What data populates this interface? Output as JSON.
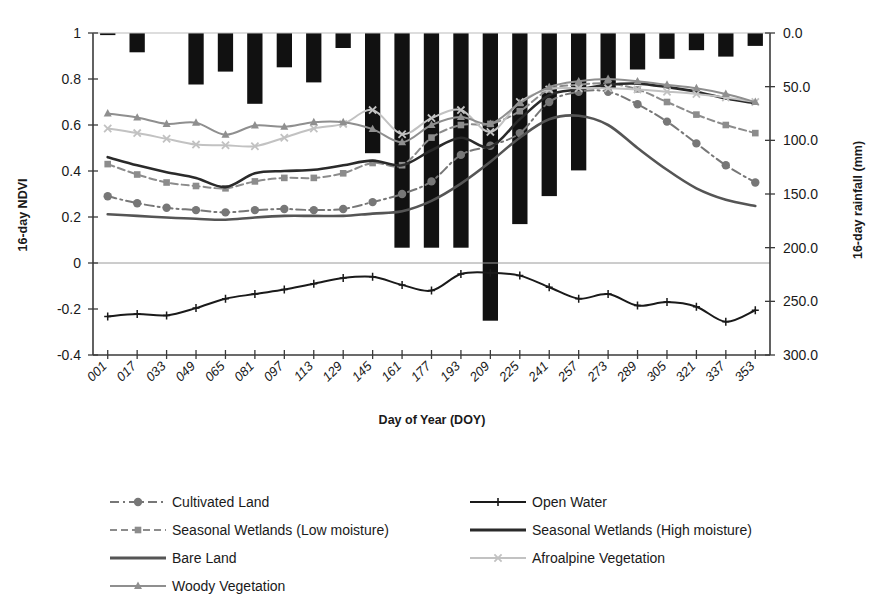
{
  "chart_data": {
    "type": "line",
    "title": "",
    "subtitle": "",
    "xlabel": "Day of Year (DOY)",
    "ylabel": "16-day NDVI",
    "y2label": "16-day rainfall (mm)",
    "ylim": [
      -0.4,
      1.0
    ],
    "yticks": [
      "-0.4",
      "-0.2",
      "0",
      "0.2",
      "0.4",
      "0.6",
      "0.8",
      "1"
    ],
    "ytick_values": [
      -0.4,
      -0.2,
      0,
      0.2,
      0.4,
      0.6,
      0.8,
      1
    ],
    "y2lim": [
      300.0,
      0.0
    ],
    "y2ticks": [
      "0.0",
      "50.0",
      "100.0",
      "150.0",
      "200.0",
      "250.0",
      "300.0"
    ],
    "y2tick_values": [
      0,
      50,
      100,
      150,
      200,
      250,
      300
    ],
    "y2_inverted": true,
    "grid": false,
    "legend_position": "bottom",
    "categories": [
      "001",
      "017",
      "033",
      "049",
      "065",
      "081",
      "097",
      "113",
      "129",
      "145",
      "161",
      "177",
      "193",
      "209",
      "225",
      "241",
      "257",
      "273",
      "289",
      "305",
      "321",
      "337",
      "353"
    ],
    "bars": {
      "name": "16-day rainfall",
      "axis": "right",
      "color": "#111111",
      "values": [
        2,
        18,
        0,
        48,
        36,
        66,
        32,
        46,
        14,
        112,
        200,
        200,
        200,
        268,
        178,
        152,
        128,
        52,
        34,
        24,
        16,
        22,
        12
      ]
    },
    "series": [
      {
        "name": "Cultivated Land",
        "axis": "left",
        "color": "#777777",
        "marker": "circle",
        "dash": "dash-dot",
        "values": [
          0.29,
          0.26,
          0.24,
          0.23,
          0.22,
          0.23,
          0.235,
          0.23,
          0.235,
          0.265,
          0.3,
          0.355,
          0.47,
          0.51,
          0.565,
          0.7,
          0.745,
          0.745,
          0.69,
          0.615,
          0.52,
          0.425,
          0.35
        ]
      },
      {
        "name": "Open Water",
        "axis": "left",
        "color": "#1a1a1a",
        "marker": "plus",
        "dash": "solid",
        "values": [
          -0.232,
          -0.222,
          -0.228,
          -0.196,
          -0.155,
          -0.135,
          -0.115,
          -0.09,
          -0.065,
          -0.06,
          -0.095,
          -0.12,
          -0.048,
          -0.042,
          -0.055,
          -0.105,
          -0.155,
          -0.135,
          -0.185,
          -0.17,
          -0.19,
          -0.255,
          -0.205
        ]
      },
      {
        "name": "Seasonal Wetlands (Low moisture)",
        "axis": "left",
        "color": "#8c8c8c",
        "marker": "square",
        "dash": "dash",
        "values": [
          0.43,
          0.385,
          0.35,
          0.335,
          0.325,
          0.355,
          0.37,
          0.37,
          0.39,
          0.435,
          0.425,
          0.545,
          0.6,
          0.605,
          0.66,
          0.755,
          0.775,
          0.78,
          0.755,
          0.7,
          0.645,
          0.6,
          0.565
        ]
      },
      {
        "name": "Seasonal Wetlands (High moisture)",
        "axis": "left",
        "color": "#2a2a2a",
        "marker": "none",
        "dash": "solid",
        "values": [
          0.46,
          0.425,
          0.395,
          0.37,
          0.33,
          0.39,
          0.4,
          0.405,
          0.425,
          0.445,
          0.425,
          0.49,
          0.545,
          0.505,
          0.625,
          0.73,
          0.755,
          0.775,
          0.78,
          0.765,
          0.745,
          0.715,
          0.695
        ]
      },
      {
        "name": "Bare Land",
        "axis": "left",
        "color": "#555555",
        "marker": "none",
        "dash": "solid",
        "values": [
          0.212,
          0.205,
          0.198,
          0.192,
          0.188,
          0.198,
          0.205,
          0.205,
          0.205,
          0.215,
          0.225,
          0.27,
          0.345,
          0.44,
          0.545,
          0.625,
          0.64,
          0.6,
          0.5,
          0.405,
          0.325,
          0.275,
          0.248
        ]
      },
      {
        "name": "Afroalpine Vegetation",
        "axis": "left",
        "color": "#c2c2c2",
        "marker": "x",
        "dash": "solid",
        "values": [
          0.585,
          0.565,
          0.54,
          0.515,
          0.512,
          0.508,
          0.545,
          0.585,
          0.605,
          0.665,
          0.56,
          0.63,
          0.665,
          0.57,
          0.7,
          0.755,
          0.76,
          0.76,
          0.755,
          0.745,
          0.735,
          0.72,
          0.7
        ]
      },
      {
        "name": "Woody Vegetation",
        "axis": "left",
        "color": "#8f8f8f",
        "marker": "triangle",
        "dash": "solid",
        "values": [
          0.65,
          0.632,
          0.605,
          0.61,
          0.558,
          0.598,
          0.592,
          0.612,
          0.612,
          0.582,
          0.525,
          0.6,
          0.635,
          0.605,
          0.695,
          0.765,
          0.79,
          0.8,
          0.79,
          0.775,
          0.76,
          0.735,
          0.7
        ]
      }
    ]
  },
  "legend": {
    "entries": [
      {
        "label": "Cultivated Land",
        "series": "Cultivated Land"
      },
      {
        "label": "Open Water",
        "series": "Open Water"
      },
      {
        "label": "Seasonal Wetlands (Low moisture)",
        "series": "Seasonal Wetlands (Low moisture)"
      },
      {
        "label": "Seasonal Wetlands (High moisture)",
        "series": "Seasonal Wetlands (High moisture)"
      },
      {
        "label": "Bare Land",
        "series": "Bare Land"
      },
      {
        "label": "Afroalpine Vegetation",
        "series": "Afroalpine Vegetation"
      },
      {
        "label": "Woody Vegetation",
        "series": "Woody Vegetation"
      }
    ]
  }
}
